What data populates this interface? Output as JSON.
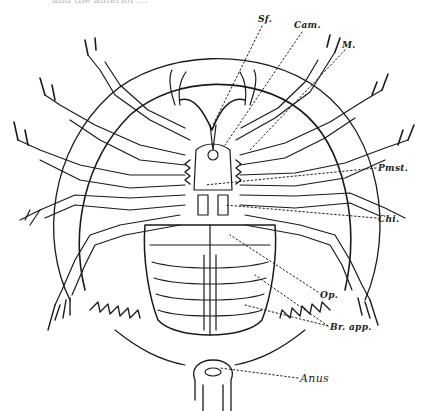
{
  "figure": {
    "cropped_caption_fragment": "and the anterior ...",
    "labels": [
      {
        "id": "sf",
        "text": "Sf.",
        "x": 258,
        "y": 14
      },
      {
        "id": "cam",
        "text": "Cam.",
        "x": 294,
        "y": 20
      },
      {
        "id": "m",
        "text": "M.",
        "x": 342,
        "y": 40
      },
      {
        "id": "pmst",
        "text": "Pmst.",
        "x": 378,
        "y": 163
      },
      {
        "id": "chi",
        "text": "Chi.",
        "x": 378,
        "y": 214
      },
      {
        "id": "op",
        "text": "Op.",
        "x": 320,
        "y": 290
      },
      {
        "id": "br_app",
        "text": "Br. app.",
        "x": 330,
        "y": 322
      },
      {
        "id": "anus",
        "text": "Anus",
        "x": 300,
        "y": 375
      }
    ],
    "line_color": "#1a1a1a",
    "background": "#ffffff"
  }
}
